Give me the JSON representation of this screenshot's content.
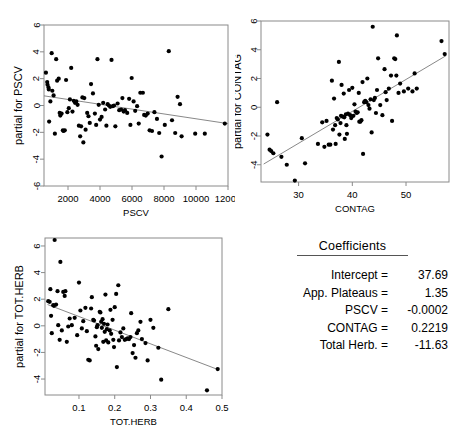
{
  "figure": {
    "title": "",
    "panel_count": 4
  },
  "coefficients": {
    "title": "Coefficients",
    "rows": [
      {
        "label": "Intercept =",
        "value": "37.69"
      },
      {
        "label": "App. Plateaus =",
        "value": "1.35"
      },
      {
        "label": "PSCV =",
        "value": "-0.0002"
      },
      {
        "label": "CONTAG =",
        "value": "0.2219"
      },
      {
        "label": "Total Herb. =",
        "value": "-11.63"
      }
    ]
  },
  "chart_data": [
    {
      "type": "scatter",
      "title": "",
      "xlabel": "PSCV",
      "ylabel": "partial for PSCV",
      "xlim": [
        500,
        12000
      ],
      "ylim": [
        -6,
        6
      ],
      "xticks": [
        2000,
        4000,
        6000,
        8000,
        10000,
        12000
      ],
      "xticklabels": [
        "2000",
        "4000",
        "6000",
        "8000",
        "10000",
        "12000"
      ],
      "yticks": [
        -6,
        -4,
        -2,
        0,
        2,
        4,
        6
      ],
      "yticklabels": [
        "-6",
        "-4",
        "-2",
        "0",
        "2",
        "4",
        "6"
      ],
      "grid": false,
      "legend": "none",
      "trendline": {
        "x": [
          500,
          12000
        ],
        "y": [
          0.72,
          -1.35
        ]
      },
      "points": [
        [
          620,
          2.45
        ],
        [
          700,
          1.75
        ],
        [
          720,
          1.55
        ],
        [
          780,
          1.35
        ],
        [
          800,
          1.2
        ],
        [
          820,
          -1.2
        ],
        [
          900,
          0.3
        ],
        [
          980,
          3.9
        ],
        [
          1020,
          1.1
        ],
        [
          1100,
          0.75
        ],
        [
          1180,
          -2.1
        ],
        [
          1260,
          3.45
        ],
        [
          1320,
          1.85
        ],
        [
          1420,
          2.0
        ],
        [
          1480,
          -0.55
        ],
        [
          1520,
          -0.75
        ],
        [
          1600,
          -0.6
        ],
        [
          1680,
          -1.85
        ],
        [
          1720,
          -1.9
        ],
        [
          1800,
          -1.85
        ],
        [
          1880,
          1.9
        ],
        [
          1960,
          -0.5
        ],
        [
          2050,
          -0.2
        ],
        [
          2120,
          0.45
        ],
        [
          2200,
          2.8
        ],
        [
          2280,
          -0.45
        ],
        [
          2360,
          0.35
        ],
        [
          2440,
          0.2
        ],
        [
          2520,
          0.3
        ],
        [
          2600,
          0.05
        ],
        [
          2680,
          -1.5
        ],
        [
          2760,
          -2.3
        ],
        [
          2820,
          -1.55
        ],
        [
          2900,
          0.6
        ],
        [
          2960,
          -2.75
        ],
        [
          3020,
          0.55
        ],
        [
          3100,
          -1.8
        ],
        [
          3200,
          -0.55
        ],
        [
          3280,
          -0.8
        ],
        [
          3360,
          -1.3
        ],
        [
          3440,
          1.6
        ],
        [
          3560,
          0.9
        ],
        [
          3680,
          -0.6
        ],
        [
          3760,
          -1.45
        ],
        [
          3840,
          3.45
        ],
        [
          3920,
          0.05
        ],
        [
          4000,
          -1.05
        ],
        [
          4100,
          -0.85
        ],
        [
          4200,
          0.2
        ],
        [
          4320,
          -0.3
        ],
        [
          4400,
          -1.5
        ],
        [
          4480,
          0.1
        ],
        [
          4560,
          0.0
        ],
        [
          4640,
          -0.1
        ],
        [
          4720,
          3.4
        ],
        [
          4800,
          -0.05
        ],
        [
          4880,
          0.0
        ],
        [
          4960,
          -1.55
        ],
        [
          5100,
          0.15
        ],
        [
          5200,
          -0.35
        ],
        [
          5320,
          -0.3
        ],
        [
          5400,
          0.55
        ],
        [
          5480,
          -0.45
        ],
        [
          5560,
          -0.35
        ],
        [
          5700,
          -0.55
        ],
        [
          5820,
          0.5
        ],
        [
          5900,
          -1.45
        ],
        [
          5980,
          2.05
        ],
        [
          6100,
          0.3
        ],
        [
          6200,
          -0.4
        ],
        [
          6320,
          -0.05
        ],
        [
          6420,
          -1.35
        ],
        [
          6520,
          0.95
        ],
        [
          6680,
          0.95
        ],
        [
          6760,
          -0.7
        ],
        [
          6860,
          -0.75
        ],
        [
          6980,
          -0.6
        ],
        [
          7100,
          -1.85
        ],
        [
          7250,
          -1.9
        ],
        [
          7400,
          -0.5
        ],
        [
          7560,
          -1.0
        ],
        [
          7700,
          -2.05
        ],
        [
          7850,
          -3.8
        ],
        [
          8050,
          -1.45
        ],
        [
          8300,
          4.05
        ],
        [
          8500,
          -1.1
        ],
        [
          8700,
          -2.05
        ],
        [
          8850,
          0.65
        ],
        [
          9000,
          0.1
        ],
        [
          9100,
          -2.3
        ],
        [
          9950,
          -2.1
        ],
        [
          10550,
          -2.1
        ],
        [
          11800,
          -1.35
        ]
      ]
    },
    {
      "type": "scatter",
      "title": "",
      "xlabel": "CONTAG",
      "ylabel": "partial for CONTAG",
      "xlim": [
        23,
        58
      ],
      "ylim": [
        -5.2,
        6
      ],
      "xticks": [
        30,
        40,
        50
      ],
      "xticklabels": [
        "30",
        "40",
        "50"
      ],
      "yticks": [
        -4,
        -2,
        0,
        2,
        4,
        6
      ],
      "yticklabels": [
        "-4",
        "-2",
        "0",
        "2",
        "4",
        "6"
      ],
      "grid": false,
      "legend": "none",
      "trendline": {
        "x": [
          23.5,
          57.5
        ],
        "y": [
          -3.95,
          3.6
        ]
      },
      "points": [
        [
          24.2,
          -1.9
        ],
        [
          24.6,
          -2.95
        ],
        [
          24.9,
          -3.05
        ],
        [
          25.3,
          -3.2
        ],
        [
          26.0,
          0.35
        ],
        [
          26.8,
          -3.45
        ],
        [
          27.8,
          -4.0
        ],
        [
          29.3,
          -5.1
        ],
        [
          30.6,
          -2.15
        ],
        [
          31.2,
          -3.9
        ],
        [
          33.6,
          -2.55
        ],
        [
          34.4,
          -1.05
        ],
        [
          34.8,
          -2.75
        ],
        [
          35.2,
          -0.95
        ],
        [
          35.6,
          -2.6
        ],
        [
          35.9,
          -2.6
        ],
        [
          36.2,
          1.85
        ],
        [
          36.4,
          -1.55
        ],
        [
          36.6,
          0.6
        ],
        [
          36.8,
          -1.25
        ],
        [
          36.9,
          -2.55
        ],
        [
          37.1,
          -0.75
        ],
        [
          37.3,
          -0.85
        ],
        [
          37.5,
          3.15
        ],
        [
          37.6,
          -1.9
        ],
        [
          37.8,
          -1.1
        ],
        [
          37.9,
          -0.6
        ],
        [
          38.0,
          1.55
        ],
        [
          38.2,
          -0.65
        ],
        [
          38.4,
          0.95
        ],
        [
          38.5,
          -0.7
        ],
        [
          38.6,
          -2.2
        ],
        [
          38.8,
          -0.5
        ],
        [
          38.9,
          -1.25
        ],
        [
          39.0,
          -1.85
        ],
        [
          39.2,
          -0.45
        ],
        [
          39.4,
          1.2
        ],
        [
          39.6,
          -0.55
        ],
        [
          39.8,
          -0.75
        ],
        [
          40.0,
          1.35
        ],
        [
          40.2,
          -0.6
        ],
        [
          40.4,
          0.2
        ],
        [
          40.6,
          -0.3
        ],
        [
          40.8,
          -0.4
        ],
        [
          41.0,
          -0.35
        ],
        [
          41.2,
          1.0
        ],
        [
          41.3,
          -1.0
        ],
        [
          41.5,
          -1.0
        ],
        [
          41.7,
          -0.9
        ],
        [
          41.9,
          1.75
        ],
        [
          42.0,
          -3.25
        ],
        [
          42.2,
          0.35
        ],
        [
          42.4,
          0.45
        ],
        [
          42.6,
          0.35
        ],
        [
          42.8,
          2.0
        ],
        [
          43.0,
          0.15
        ],
        [
          43.2,
          -0.1
        ],
        [
          43.4,
          0.55
        ],
        [
          43.6,
          -1.75
        ],
        [
          43.8,
          5.6
        ],
        [
          44.0,
          0.5
        ],
        [
          44.2,
          0.65
        ],
        [
          44.4,
          -0.4
        ],
        [
          44.6,
          1.2
        ],
        [
          44.8,
          3.4
        ],
        [
          45.2,
          0.15
        ],
        [
          45.6,
          -0.55
        ],
        [
          46.0,
          2.65
        ],
        [
          46.2,
          1.05
        ],
        [
          46.4,
          0.5
        ],
        [
          46.8,
          1.3
        ],
        [
          47.2,
          2.2
        ],
        [
          47.4,
          -0.95
        ],
        [
          47.8,
          3.4
        ],
        [
          48.0,
          3.35
        ],
        [
          48.2,
          2.2
        ],
        [
          48.3,
          5.0
        ],
        [
          48.6,
          1.0
        ],
        [
          48.9,
          1.65
        ],
        [
          49.6,
          1.1
        ],
        [
          50.4,
          1.3
        ],
        [
          51.2,
          1.1
        ],
        [
          51.6,
          2.35
        ],
        [
          52.0,
          1.3
        ],
        [
          56.6,
          4.6
        ],
        [
          57.2,
          3.7
        ]
      ]
    },
    {
      "type": "scatter",
      "title": "",
      "xlabel": "TOT.HERB",
      "ylabel": "partial for TOT.HERB",
      "xlim": [
        0.005,
        0.5
      ],
      "ylim": [
        -5.2,
        6.6
      ],
      "xticks": [
        0.0,
        0.1,
        0.2,
        0.3,
        0.4,
        0.5
      ],
      "xticklabels": [
        "0.0",
        "0.1",
        "0.2",
        "0.3",
        "0.4",
        "0.5"
      ],
      "yticks": [
        -4,
        -2,
        0,
        2,
        4,
        6
      ],
      "yticklabels": [
        "-4",
        "-2",
        "0",
        "2",
        "4",
        "6"
      ],
      "grid": false,
      "legend": "none",
      "trendline": {
        "x": [
          0.012,
          0.49
        ],
        "y": [
          1.6,
          -3.3
        ]
      },
      "points": [
        [
          0.014,
          1.85
        ],
        [
          0.018,
          1.8
        ],
        [
          0.02,
          2.75
        ],
        [
          0.022,
          0.75
        ],
        [
          0.024,
          -0.55
        ],
        [
          0.028,
          1.55
        ],
        [
          0.03,
          1.5
        ],
        [
          0.032,
          6.45
        ],
        [
          0.036,
          1.6
        ],
        [
          0.04,
          2.6
        ],
        [
          0.042,
          0.05
        ],
        [
          0.046,
          -1.05
        ],
        [
          0.048,
          4.8
        ],
        [
          0.052,
          -0.35
        ],
        [
          0.056,
          2.55
        ],
        [
          0.06,
          2.25
        ],
        [
          0.062,
          2.6
        ],
        [
          0.066,
          -1.2
        ],
        [
          0.07,
          -0.05
        ],
        [
          0.074,
          0.55
        ],
        [
          0.08,
          0.05
        ],
        [
          0.088,
          0.6
        ],
        [
          0.095,
          -0.7
        ],
        [
          0.1,
          3.25
        ],
        [
          0.104,
          1.15
        ],
        [
          0.108,
          -0.2
        ],
        [
          0.112,
          0.35
        ],
        [
          0.118,
          1.35
        ],
        [
          0.122,
          -0.4
        ],
        [
          0.126,
          -2.55
        ],
        [
          0.13,
          -2.6
        ],
        [
          0.134,
          1.3
        ],
        [
          0.136,
          2.15
        ],
        [
          0.14,
          0.45
        ],
        [
          0.142,
          0.4
        ],
        [
          0.146,
          -0.8
        ],
        [
          0.148,
          -1.5
        ],
        [
          0.15,
          -0.1
        ],
        [
          0.152,
          0.05
        ],
        [
          0.154,
          -1.75
        ],
        [
          0.158,
          1.05
        ],
        [
          0.16,
          1.0
        ],
        [
          0.162,
          0.3
        ],
        [
          0.164,
          -0.15
        ],
        [
          0.166,
          0.5
        ],
        [
          0.168,
          -1.2
        ],
        [
          0.17,
          0.15
        ],
        [
          0.172,
          -0.45
        ],
        [
          0.174,
          2.35
        ],
        [
          0.176,
          -1.1
        ],
        [
          0.178,
          -0.25
        ],
        [
          0.18,
          0.1
        ],
        [
          0.182,
          -1.25
        ],
        [
          0.186,
          -0.35
        ],
        [
          0.188,
          1.2
        ],
        [
          0.19,
          -0.6
        ],
        [
          0.194,
          0.45
        ],
        [
          0.196,
          -1.05
        ],
        [
          0.198,
          -1.6
        ],
        [
          0.2,
          1.4
        ],
        [
          0.204,
          2.4
        ],
        [
          0.206,
          -3.1
        ],
        [
          0.21,
          3.05
        ],
        [
          0.212,
          -1.1
        ],
        [
          0.216,
          -0.5
        ],
        [
          0.22,
          -0.85
        ],
        [
          0.224,
          -0.2
        ],
        [
          0.228,
          -1.05
        ],
        [
          0.232,
          -1.0
        ],
        [
          0.236,
          -0.95
        ],
        [
          0.24,
          -1.0
        ],
        [
          0.244,
          -0.85
        ],
        [
          0.246,
          0.95
        ],
        [
          0.25,
          -2.05
        ],
        [
          0.254,
          -1.45
        ],
        [
          0.258,
          -2.4
        ],
        [
          0.262,
          -0.55
        ],
        [
          0.266,
          -0.35
        ],
        [
          0.272,
          0.3
        ],
        [
          0.276,
          -1.0
        ],
        [
          0.286,
          -1.3
        ],
        [
          0.292,
          -2.6
        ],
        [
          0.3,
          0.45
        ],
        [
          0.308,
          -0.15
        ],
        [
          0.322,
          -1.65
        ],
        [
          0.33,
          -4.05
        ],
        [
          0.35,
          1.25
        ],
        [
          0.458,
          -4.85
        ],
        [
          0.488,
          -3.25
        ]
      ]
    }
  ]
}
